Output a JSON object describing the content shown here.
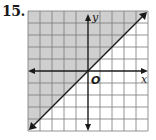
{
  "problem": {
    "number": "15."
  },
  "graph": {
    "x_axis_label": "x",
    "y_axis_label": "y",
    "origin_label": "O",
    "grid": {
      "x_min": -5,
      "x_max": 5,
      "y_min": -5,
      "y_max": 5,
      "cell_px": 12,
      "origin_px": [
        88,
        71
      ]
    },
    "boundary": {
      "equation": "y = x",
      "style": "solid",
      "slope": 1,
      "intercept": 0
    },
    "shaded_region": "above-left of line (y >= x)",
    "colors": {
      "shade": "#cfcfcf",
      "grid_line": "#7a7a7a",
      "axis": "#1a1a1a",
      "boundary": "#1a1a1a"
    }
  }
}
